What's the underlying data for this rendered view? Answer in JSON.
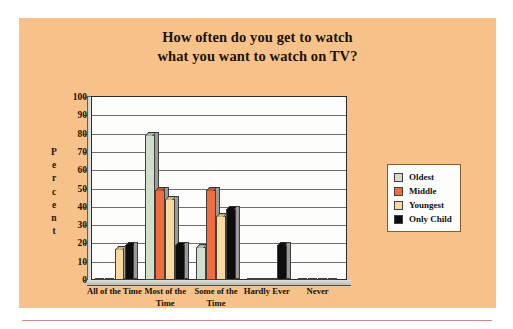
{
  "figure": {
    "background_color": "#f6c289",
    "plot_background_color": "#fdfdfb",
    "bottom_rule_color": "#d08a8a"
  },
  "chart_data": {
    "type": "bar",
    "title": "How often do you get to watch what you want to watch on TV?",
    "title_lines": [
      "How often do you get to watch",
      "what you want to watch on TV?"
    ],
    "xlabel": "",
    "ylabel": "Percent",
    "ylabel_letters": [
      "P",
      "e",
      "r",
      "c",
      "e",
      "n",
      "t"
    ],
    "ylim": [
      0,
      100
    ],
    "ytick_step": 10,
    "yticks": [
      100,
      90,
      80,
      70,
      60,
      50,
      40,
      30,
      20,
      10,
      0
    ],
    "ytick_labels": [
      "100",
      "90",
      "80",
      "70",
      "60",
      "50",
      "40",
      "30",
      "20",
      "10",
      "0"
    ],
    "grid": true,
    "legend_position": "right",
    "categories": [
      "All of the Time",
      "Most of the Time",
      "Some of the Time",
      "Hardly Ever",
      "Never"
    ],
    "category_lines": [
      [
        "All of the Time"
      ],
      [
        "Most of the",
        "Time"
      ],
      [
        "Some of the",
        "Time"
      ],
      [
        "Hardly Ever"
      ],
      [
        "Never"
      ]
    ],
    "series": [
      {
        "name": "Oldest",
        "color": "#cfdfc9",
        "values": [
          0,
          79,
          18,
          0,
          0
        ]
      },
      {
        "name": "Middle",
        "color": "#ef6d3f",
        "values": [
          0,
          49,
          49,
          0,
          0
        ]
      },
      {
        "name": "Youngest",
        "color": "#fad9a0",
        "values": [
          17,
          44,
          35,
          0,
          0
        ]
      },
      {
        "name": "Only Child",
        "color": "#0d0d0d",
        "values": [
          19,
          19,
          39,
          19,
          0
        ]
      }
    ]
  },
  "legend": {
    "items": [
      {
        "label": "Oldest",
        "color": "#cfdfc9"
      },
      {
        "label": "Middle",
        "color": "#ef6d3f"
      },
      {
        "label": "Youngest",
        "color": "#fad9a0"
      },
      {
        "label": "Only Child",
        "color": "#0d0d0d"
      }
    ]
  }
}
